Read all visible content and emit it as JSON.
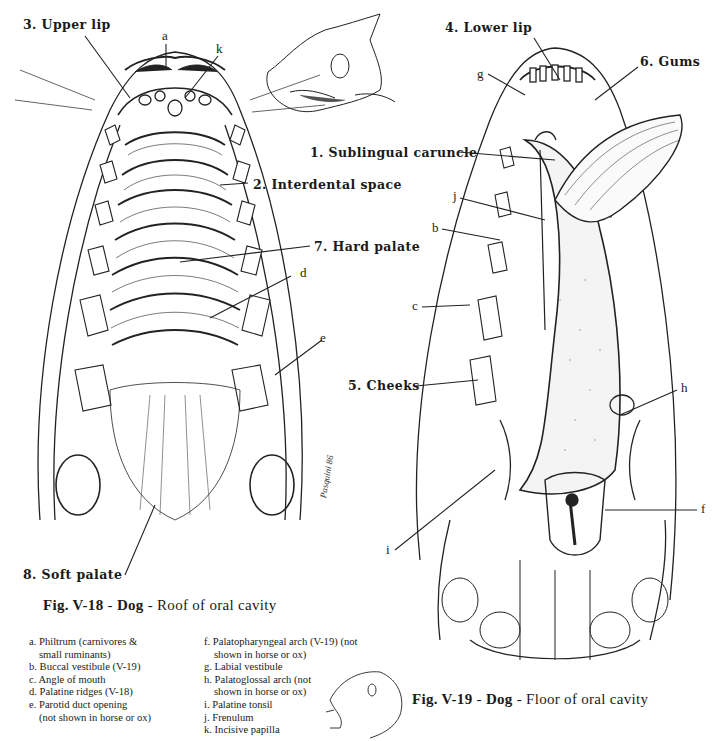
{
  "figure_18": {
    "caption_fig": "Fig. V-18",
    "caption_sep1": " - ",
    "caption_animal": "Dog",
    "caption_sep2": " - ",
    "caption_desc": "Roof of oral cavity",
    "labels": {
      "upper_lip": "3. Upper lip",
      "interdental_space": "2. Interdental space",
      "hard_palate": "7. Hard palate",
      "soft_palate": "8. Soft palate",
      "a": "a",
      "k": "k",
      "d": "d",
      "e": "e"
    },
    "signature": "Pasquini 86"
  },
  "figure_19": {
    "caption_fig": "Fig. V-19",
    "caption_sep1": " - ",
    "caption_animal": "Dog",
    "caption_sep2": " - ",
    "caption_desc": "Floor of oral cavity",
    "labels": {
      "lower_lip": "4. Lower lip",
      "gums": "6. Gums",
      "sublingual_caruncle": "1. Sublingual caruncle",
      "cheeks": "5. Cheeks",
      "g": "g",
      "j": "j",
      "b": "b",
      "c": "c",
      "h": "h",
      "f": "f",
      "i": "i"
    }
  },
  "legend": {
    "left": [
      "a. Philtrum (carnivores &",
      "small ruminants)",
      "b. Buccal vestibule (V-19)",
      "c. Angle of mouth",
      "d. Palatine ridges (V-18)",
      "e. Parotid duct opening",
      "(not shown in horse or ox)"
    ],
    "right": [
      "f. Palatopharyngeal arch (V-19) (not",
      "shown in horse or ox)",
      "g. Labial vestibule",
      "h. Palatoglossal arch (not",
      "shown in horse or ox)",
      "i. Palatine tonsil",
      "j. Frenulum",
      "k. Incisive papilla"
    ]
  }
}
